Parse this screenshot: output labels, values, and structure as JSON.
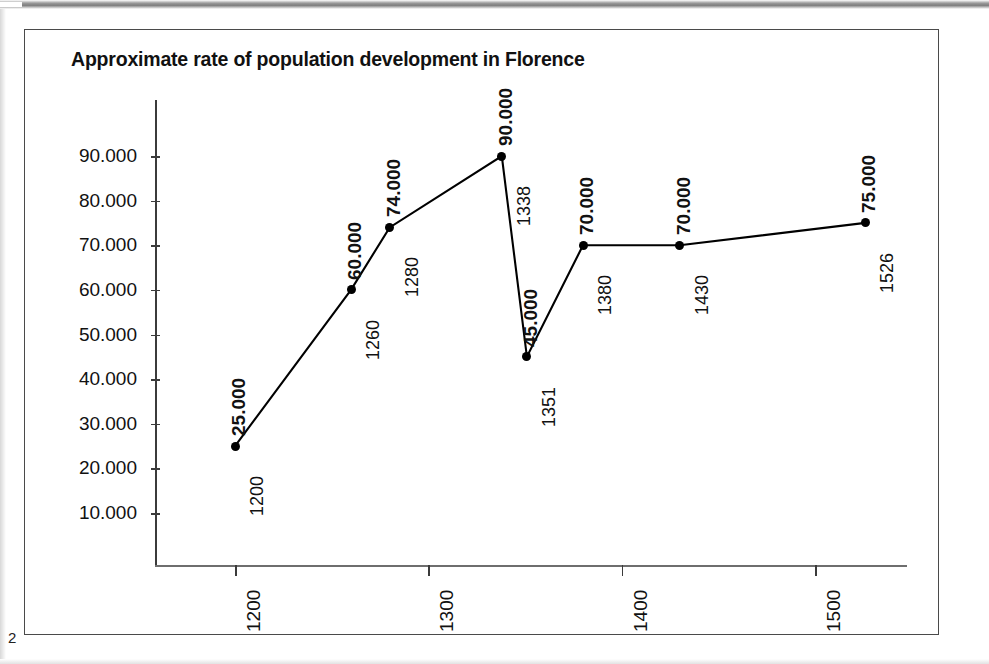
{
  "page": {
    "number": "2"
  },
  "figure": {
    "title": "Approximate rate of population development in Florence"
  },
  "chart_data": {
    "type": "line",
    "title": "Approximate rate of population development in Florence",
    "xlabel": "",
    "ylabel": "",
    "xlim": [
      1160,
      1560
    ],
    "ylim": [
      0,
      95000
    ],
    "grid": false,
    "legend": false,
    "x": [
      1200,
      1260,
      1280,
      1338,
      1351,
      1380,
      1430,
      1526
    ],
    "values": [
      25000,
      60000,
      74000,
      90000,
      45000,
      70000,
      70000,
      75000
    ],
    "point_labels": [
      {
        "year": "1200",
        "value": "25.000"
      },
      {
        "year": "1260",
        "value": "60.000"
      },
      {
        "year": "1280",
        "value": "74.000"
      },
      {
        "year": "1338",
        "value": "90.000"
      },
      {
        "year": "1351",
        "value": "45.000"
      },
      {
        "year": "1380",
        "value": "70.000"
      },
      {
        "year": "1430",
        "value": "70.000"
      },
      {
        "year": "1526",
        "value": "75.000"
      }
    ],
    "y_ticks": [
      10000,
      20000,
      30000,
      40000,
      50000,
      60000,
      70000,
      80000,
      90000
    ],
    "y_tick_labels": [
      "10.000",
      "20.000",
      "30.000",
      "40.000",
      "50.000",
      "60.000",
      "70.000",
      "80.000",
      "90.000"
    ],
    "x_ticks": [
      1200,
      1300,
      1400,
      1500
    ],
    "x_tick_labels": [
      "1200",
      "1300",
      "1400",
      "1500"
    ],
    "series_color": "#000000",
    "axis_color": "#3b3b3b"
  }
}
